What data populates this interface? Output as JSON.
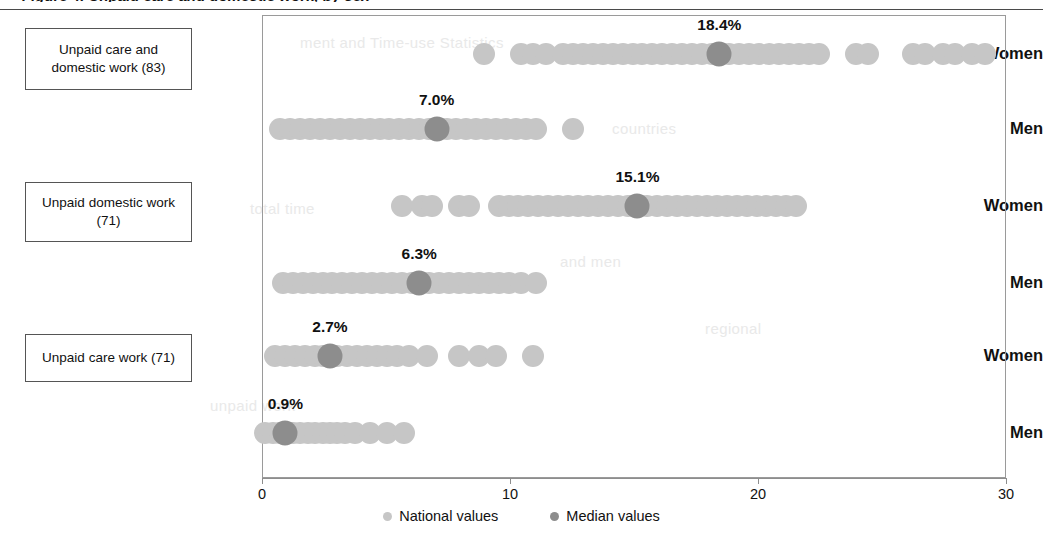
{
  "figure": {
    "title_fragment": "Figure 4. Unpaid care and domestic work, by sex",
    "axis": {
      "ticks": [
        0,
        10,
        20,
        30
      ],
      "tick_labels": [
        "0",
        "10",
        "20",
        "30"
      ],
      "xmin": 0,
      "xmax": 30,
      "xlabel": "",
      "grid": false
    },
    "legend": {
      "position": "bottom-center",
      "items": [
        {
          "label": "National values",
          "color": "#c6c6c6",
          "key": "national"
        },
        {
          "label": "Median values",
          "color": "#8d8d8d",
          "key": "median"
        }
      ]
    },
    "categories": [
      {
        "id": "care-and-domestic",
        "label": "Unpaid care and domestic work (83)",
        "count": 83
      },
      {
        "id": "domestic",
        "label": "Unpaid domestic work (71)",
        "count": 71
      },
      {
        "id": "care",
        "label": "Unpaid care work (71)",
        "count": 71
      }
    ],
    "sex_labels": [
      "Women",
      "Men",
      "Women",
      "Men",
      "Women",
      "Men"
    ],
    "ghost_text": [
      {
        "text": "ment and Time-use Statistics",
        "x": 300,
        "y": 34
      },
      {
        "text": "countries",
        "x": 612,
        "y": 120
      },
      {
        "text": "total time",
        "x": 250,
        "y": 200
      },
      {
        "text": "and men",
        "x": 560,
        "y": 253
      },
      {
        "text": "regional",
        "x": 705,
        "y": 320
      },
      {
        "text": "unpaid work",
        "x": 210,
        "y": 397
      }
    ]
  },
  "chart_data": {
    "type": "scatter",
    "title": "Figure 4. Unpaid care and domestic work, by sex",
    "xlabel": "",
    "ylabel": "",
    "xlim": [
      0,
      30
    ],
    "xticks": [
      0,
      10,
      20,
      30
    ],
    "grid": false,
    "legend": [
      "National values",
      "Median values"
    ],
    "unit": "percent of time",
    "rows": [
      {
        "category": "Unpaid care and domestic work (83)",
        "sex": "Women",
        "median": 18.4,
        "median_label": "18.4%",
        "n": 83,
        "national_values": [
          8.9,
          10.4,
          10.9,
          11.4,
          12.1,
          12.5,
          12.9,
          13.3,
          13.7,
          14.1,
          14.5,
          14.9,
          15.3,
          15.7,
          16.1,
          16.5,
          16.9,
          17.3,
          17.7,
          18.1,
          18.4,
          18.8,
          19.2,
          19.6,
          20.0,
          20.4,
          20.8,
          21.2,
          21.6,
          22.0,
          22.4,
          23.9,
          24.4,
          26.2,
          26.7,
          27.4,
          27.9,
          28.6,
          29.1
        ]
      },
      {
        "category": "Unpaid care and domestic work (83)",
        "sex": "Men",
        "median": 7.0,
        "median_label": "7.0%",
        "n": 83,
        "national_values": [
          0.7,
          1.1,
          1.5,
          1.9,
          2.3,
          2.7,
          3.1,
          3.5,
          3.9,
          4.3,
          4.7,
          5.1,
          5.5,
          5.9,
          6.3,
          6.7,
          7.0,
          7.4,
          7.8,
          8.2,
          8.6,
          9.0,
          9.4,
          9.8,
          10.2,
          10.6,
          11.0,
          12.5
        ]
      },
      {
        "category": "Unpaid domestic work (71)",
        "sex": "Women",
        "median": 15.1,
        "median_label": "15.1%",
        "n": 71,
        "national_values": [
          5.6,
          6.4,
          6.8,
          7.9,
          8.3,
          9.5,
          9.9,
          10.3,
          10.7,
          11.1,
          11.5,
          11.9,
          12.3,
          12.7,
          13.1,
          13.5,
          13.9,
          14.3,
          14.7,
          15.1,
          15.5,
          15.9,
          16.3,
          16.7,
          17.1,
          17.5,
          17.9,
          18.3,
          18.7,
          19.1,
          19.5,
          19.9,
          20.3,
          20.7,
          21.1,
          21.5
        ]
      },
      {
        "category": "Unpaid domestic work (71)",
        "sex": "Men",
        "median": 6.3,
        "median_label": "6.3%",
        "n": 71,
        "national_values": [
          0.8,
          1.2,
          1.6,
          2.0,
          2.4,
          2.8,
          3.2,
          3.6,
          4.0,
          4.4,
          4.8,
          5.2,
          5.6,
          6.0,
          6.3,
          6.7,
          7.1,
          7.5,
          7.9,
          8.3,
          8.7,
          9.1,
          9.5,
          9.9,
          10.4,
          11.0
        ]
      },
      {
        "category": "Unpaid care work (71)",
        "sex": "Women",
        "median": 2.7,
        "median_label": "2.7%",
        "n": 71,
        "national_values": [
          0.5,
          0.9,
          1.3,
          1.7,
          2.1,
          2.4,
          2.7,
          3.0,
          3.4,
          3.8,
          4.2,
          4.6,
          5.0,
          5.4,
          5.9,
          6.6,
          7.9,
          8.7,
          9.4,
          10.9
        ]
      },
      {
        "category": "Unpaid care work (71)",
        "sex": "Men",
        "median": 0.9,
        "median_label": "0.9%",
        "n": 71,
        "national_values": [
          0.1,
          0.4,
          0.7,
          0.9,
          1.2,
          1.5,
          1.8,
          2.1,
          2.4,
          2.7,
          3.0,
          3.3,
          3.7,
          4.3,
          5.0,
          5.7
        ]
      }
    ]
  }
}
